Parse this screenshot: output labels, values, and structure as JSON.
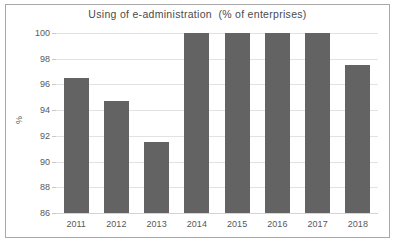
{
  "chart_data": {
    "type": "bar",
    "title": "Using of e-administration  (% of enterprises)",
    "xlabel": "",
    "ylabel": "%",
    "categories": [
      "2011",
      "2012",
      "2013",
      "2014",
      "2015",
      "2016",
      "2017",
      "2018"
    ],
    "values": [
      96.5,
      94.7,
      91.5,
      100,
      100,
      100,
      100,
      97.5
    ],
    "ylim": [
      86,
      100
    ],
    "ytick_labels": [
      "100",
      "98",
      "96",
      "94",
      "92",
      "90",
      "88",
      "86"
    ],
    "yticks": [
      100,
      98,
      96,
      94,
      92,
      90,
      88,
      86
    ],
    "grid": true,
    "legend": "none",
    "bar_color": "#636363",
    "grid_color": "#e2e2e2",
    "text_color": "#595959",
    "title_color": "#4a4a4a",
    "frame_color": "#a8a8a8",
    "background": "#ffffff"
  }
}
